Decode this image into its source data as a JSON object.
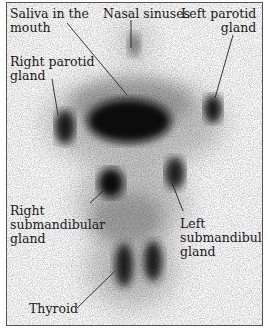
{
  "figure": {
    "type": "salivary gland scintigraphy scan (anterior view)",
    "labels": {
      "saliva": "Saliva in the\nmouth",
      "nasal": "Nasal sinuses",
      "left_parotid": "Left parotid\n          gland",
      "right_parotid": "Right parotid\ngland",
      "right_submandibular": "Right\nsubmandibular\ngland",
      "left_submandibular": "Left\nsubmandibular\ngland",
      "thyroid": "Thyroid"
    },
    "colors": {
      "uptake": "#0a0a0a",
      "background": "#fbfbfb",
      "leader_line": "#222222"
    }
  }
}
